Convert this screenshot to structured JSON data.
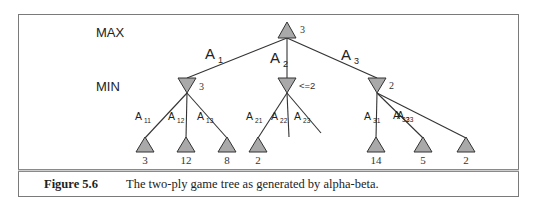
{
  "figure": {
    "number_label": "Figure 5.6",
    "caption_text": "The two-ply game tree as generated by alpha-beta."
  },
  "ply_labels": {
    "max": "MAX",
    "min": "MIN"
  },
  "colors": {
    "node_fill": "#a9a9a9",
    "node_stroke": "#333333",
    "edge": "#333333",
    "frame": "#7a7a7a"
  },
  "tree": {
    "root": {
      "type": "MAX",
      "value": "3"
    },
    "moves": [
      {
        "label": "A",
        "sub": "1",
        "min_value": "3",
        "children": [
          {
            "label": "A",
            "sub": "11",
            "value": "3"
          },
          {
            "label": "A",
            "sub": "12",
            "value": "12"
          },
          {
            "label": "A",
            "sub": "13",
            "value": "8"
          }
        ]
      },
      {
        "label": "A",
        "sub": "2",
        "min_value": "<=2",
        "children": [
          {
            "label": "A",
            "sub": "21",
            "value": "2"
          },
          {
            "label": "A",
            "sub": "22",
            "value": "",
            "pruned": true
          },
          {
            "label": "A",
            "sub": "23",
            "value": "",
            "pruned": true
          }
        ]
      },
      {
        "label": "A",
        "sub": "3",
        "min_value": "2",
        "children": [
          {
            "label": "A",
            "sub": "31",
            "value": "14"
          },
          {
            "label": "A",
            "sub": "32",
            "value": "5"
          },
          {
            "label": "A",
            "sub": "33",
            "value": "2"
          }
        ]
      }
    ]
  }
}
